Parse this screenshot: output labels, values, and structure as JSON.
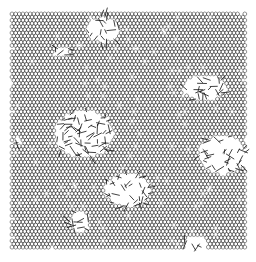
{
  "figure": {
    "width": 256,
    "height": 262,
    "background_color": "#ffffff",
    "lattice": {
      "x_min": 12,
      "x_max": 245,
      "y_min": 14,
      "y_max": 250,
      "cell_size": 2.1,
      "stroke_color": "#3a3a3a",
      "stroke_width": 0.55
    },
    "defect_regions": [
      {
        "name": "top-center",
        "cx": 103,
        "cy": 30,
        "rx": 17,
        "ry": 13
      },
      {
        "name": "upper-left-small",
        "cx": 62,
        "cy": 52,
        "rx": 8,
        "ry": 6
      },
      {
        "name": "upper-right",
        "cx": 205,
        "cy": 88,
        "rx": 22,
        "ry": 13
      },
      {
        "name": "left-center-large",
        "cx": 84,
        "cy": 134,
        "rx": 30,
        "ry": 24
      },
      {
        "name": "left-edge-small",
        "cx": 17,
        "cy": 141,
        "rx": 5,
        "ry": 5
      },
      {
        "name": "right-middle",
        "cx": 222,
        "cy": 155,
        "rx": 24,
        "ry": 20
      },
      {
        "name": "bottom-center",
        "cx": 128,
        "cy": 190,
        "rx": 24,
        "ry": 17
      },
      {
        "name": "bottom-left-faint",
        "cx": 80,
        "cy": 222,
        "rx": 10,
        "ry": 12
      },
      {
        "name": "bottom-right-small",
        "cx": 196,
        "cy": 243,
        "rx": 12,
        "ry": 7
      }
    ]
  }
}
